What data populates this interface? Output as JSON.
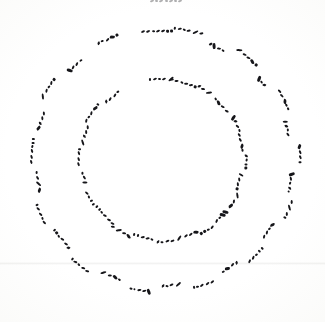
{
  "document": {
    "kind": "scanned-manuscript-page",
    "title": "Circular shorthand manuscript",
    "script_style": "stenographic / shorthand strokes",
    "layout": "two concentric rings of writing around an empty centre",
    "legible_text": "",
    "background_color": "#fdfdfc",
    "ink_color": "#16161a",
    "width_px": 325,
    "height_px": 322
  },
  "canvas": {
    "center_x": 162,
    "center_y": 158
  },
  "artifacts": {
    "top_edge_mark": {
      "label": "cropped ink mark at top edge",
      "x": 150,
      "y": 0,
      "stroke_count": 7
    },
    "scan_seam": {
      "label": "faint horizontal scanner seam",
      "y": 262
    }
  },
  "rings": [
    {
      "name": "inner-ring",
      "radius": 78,
      "word_count": 22,
      "words": [
        {
          "angle": -90,
          "radius": 80,
          "strokes": "t4 t1 t2 t1 t3",
          "lift": 0
        },
        {
          "angle": -74,
          "radius": 79,
          "strokes": "t1 t1 t2 t1 t1 t4",
          "lift": 0
        },
        {
          "angle": -58,
          "radius": 82,
          "strokes": "t6 t1 t3",
          "lift": 0
        },
        {
          "angle": -42,
          "radius": 80,
          "strokes": "t2 t5 t1 t1",
          "lift": 0
        },
        {
          "angle": -26,
          "radius": 83,
          "strokes": "t9 t6 t1 t2",
          "lift": 0
        },
        {
          "angle": -12,
          "radius": 81,
          "strokes": "t1 t1 t10 t4",
          "lift": 0
        },
        {
          "angle": 2,
          "radius": 84,
          "strokes": "t6 t2 t4 t4",
          "lift": 0
        },
        {
          "angle": 16,
          "radius": 80,
          "strokes": "t7 t1 t1 t4",
          "lift": 0
        },
        {
          "angle": 30,
          "radius": 83,
          "strokes": "t3 t1 t5",
          "lift": 0
        },
        {
          "angle": 44,
          "radius": 81,
          "strokes": "t9 t9 t2 t1",
          "lift": 0
        },
        {
          "angle": 58,
          "radius": 84,
          "strokes": "t1 t2 t4 t4",
          "lift": 0
        },
        {
          "angle": 72,
          "radius": 80,
          "strokes": "t5 t1 t1 t3",
          "lift": 0
        },
        {
          "angle": 88,
          "radius": 82,
          "strokes": "t1 t1 t2 t6",
          "lift": 0
        },
        {
          "angle": 104,
          "radius": 80,
          "strokes": "t2 t1 t1 t4 t4",
          "lift": 0
        },
        {
          "angle": 120,
          "radius": 83,
          "strokes": "t10 t1 t3 t1",
          "lift": 0
        },
        {
          "angle": 136,
          "radius": 80,
          "strokes": "t1 t1 t1 t2 t4 t4",
          "lift": 0
        },
        {
          "angle": 152,
          "radius": 82,
          "strokes": "t4 t4 t2 t1",
          "lift": 0
        },
        {
          "angle": 168,
          "radius": 80,
          "strokes": "t7 t1 t2",
          "lift": 0
        },
        {
          "angle": 182,
          "radius": 83,
          "strokes": "t1 t1 t1 t4",
          "lift": 0
        },
        {
          "angle": 198,
          "radius": 81,
          "strokes": "t3 t6 t1 t1",
          "lift": 0
        },
        {
          "angle": 214,
          "radius": 84,
          "strokes": "t1 t2 t1 t5 t4",
          "lift": 0
        },
        {
          "angle": 232,
          "radius": 80,
          "strokes": "t6 t1 t1 t2",
          "lift": 0
        }
      ]
    },
    {
      "name": "outer-ring",
      "radius": 125,
      "word_count": 26,
      "words": [
        {
          "angle": -92,
          "radius": 128,
          "strokes": "t1 t1 t2 t1 t1 t4 t4",
          "lift": 0
        },
        {
          "angle": -78,
          "radius": 131,
          "strokes": "t4 t1 t2 t1 t3 t1",
          "lift": 0
        },
        {
          "angle": -64,
          "radius": 126,
          "strokes": "t6 t9 t1 t2",
          "lift": 0
        },
        {
          "angle": -50,
          "radius": 133,
          "strokes": "t3 t1 t1 t5 t4",
          "lift": 0
        },
        {
          "angle": -38,
          "radius": 127,
          "strokes": "t9 t2 t6",
          "lift": 0
        },
        {
          "angle": -26,
          "radius": 136,
          "strokes": "t1 t1 t10 t4 t4",
          "lift": 0
        },
        {
          "angle": -14,
          "radius": 129,
          "strokes": "t7 t6 t2 t1",
          "lift": 0
        },
        {
          "angle": -2,
          "radius": 138,
          "strokes": "t5 t1 t1 t4",
          "lift": 0
        },
        {
          "angle": 10,
          "radius": 130,
          "strokes": "t9 t1 t2 t6 t4",
          "lift": 0
        },
        {
          "angle": 22,
          "radius": 136,
          "strokes": "t1 t3 t1 t4",
          "lift": 0
        },
        {
          "angle": 34,
          "radius": 128,
          "strokes": "t10 t2 t1 t1",
          "lift": 0
        },
        {
          "angle": 46,
          "radius": 134,
          "strokes": "t4 t4 t2 t1 t1",
          "lift": 0
        },
        {
          "angle": 58,
          "radius": 127,
          "strokes": "t6 t1 t5 t2",
          "lift": 0
        },
        {
          "angle": 72,
          "radius": 132,
          "strokes": "t1 t1 t1 t2 t4",
          "lift": 0
        },
        {
          "angle": 86,
          "radius": 126,
          "strokes": "t3 t1 t2 t6",
          "lift": 0
        },
        {
          "angle": 100,
          "radius": 131,
          "strokes": "t9 t1 t1 t4 t4",
          "lift": 0
        },
        {
          "angle": 114,
          "radius": 127,
          "strokes": "t2 t5 t1 t3",
          "lift": 0
        },
        {
          "angle": 128,
          "radius": 134,
          "strokes": "t1 t1 t2 t1 t4",
          "lift": 0
        },
        {
          "angle": 142,
          "radius": 128,
          "strokes": "t6 t1 t1 t2 t4 t4",
          "lift": 0
        },
        {
          "angle": 156,
          "radius": 133,
          "strokes": "t1 t2 t1 t1 t4",
          "lift": 0
        },
        {
          "angle": 170,
          "radius": 126,
          "strokes": "t10 t3 t1 t2",
          "lift": 0
        },
        {
          "angle": 184,
          "radius": 130,
          "strokes": "t1 t1 t1 t2 t4 t4",
          "lift": 0
        },
        {
          "angle": 198,
          "radius": 127,
          "strokes": "t5 t6 t1 t1",
          "lift": 0
        },
        {
          "angle": 212,
          "radius": 134,
          "strokes": "t3 t1 t2 t1 t4",
          "lift": 0
        },
        {
          "angle": 228,
          "radius": 129,
          "strokes": "t9 t1 t1 t2",
          "lift": 0
        },
        {
          "angle": 246,
          "radius": 132,
          "strokes": "t6 t2 t1 t5 t4",
          "lift": 0
        }
      ]
    }
  ]
}
